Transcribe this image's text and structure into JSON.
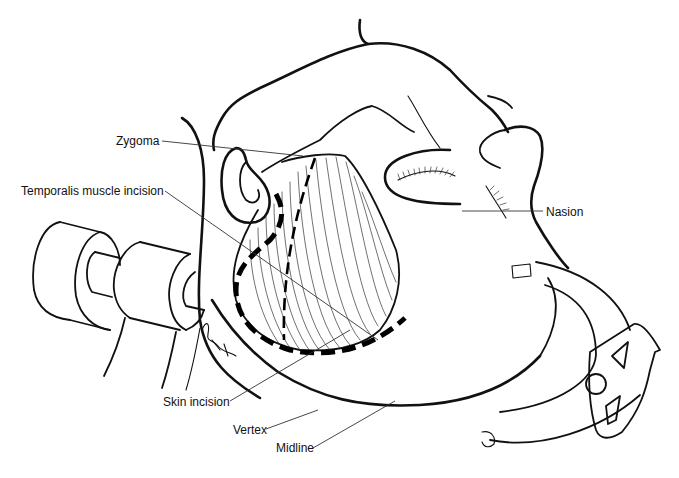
{
  "figure": {
    "labels": {
      "zygoma": "Zygoma",
      "temporalis": "Temporalis muscle incision",
      "nasion": "Nasion",
      "skin_incision": "Skin incision",
      "vertex": "Vertex",
      "midline": "Midline"
    },
    "signature": "B.Bkt '91",
    "colors": {
      "ink": "#111111",
      "background": "#ffffff"
    }
  }
}
